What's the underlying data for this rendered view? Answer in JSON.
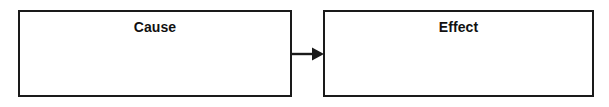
{
  "diagram": {
    "type": "cause-effect-flow",
    "background_color": "#ffffff",
    "border_color": "#1a1a1a",
    "text_color": "#111111",
    "nodes": [
      {
        "id": "cause",
        "label": "Cause"
      },
      {
        "id": "effect",
        "label": "Effect"
      }
    ],
    "connector": {
      "id": "cause-to-effect",
      "icon": "arrow-right-icon",
      "from": "cause",
      "to": "effect",
      "direction": "right"
    }
  }
}
